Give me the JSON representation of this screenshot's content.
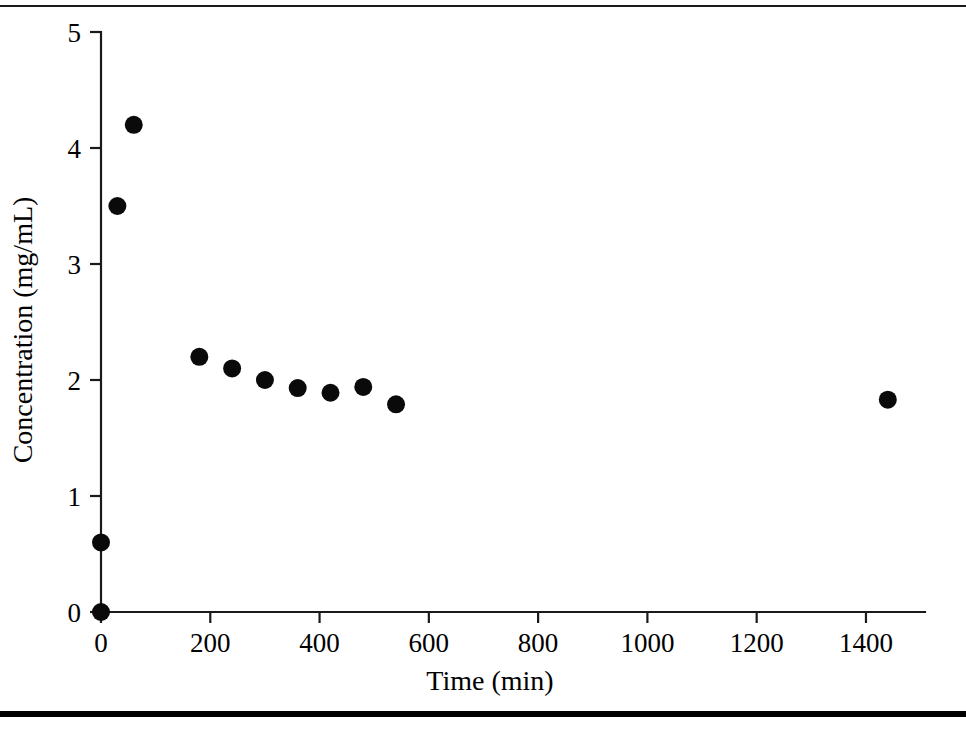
{
  "figure": {
    "type": "scatter-plot-figure",
    "background_color": "#ffffff",
    "ink_color": "#000000",
    "rules": {
      "top_rule_label": "page-rule-top",
      "bottom_rule_label": "page-rule-bottom"
    }
  },
  "chart_data": {
    "type": "scatter",
    "title": "",
    "subtitle": "",
    "xlabel": "Time (min)",
    "ylabel": "Concentration (mg/mL)",
    "xlim": [
      0,
      1510
    ],
    "ylim": [
      0,
      5
    ],
    "xticks": [
      0,
      200,
      400,
      600,
      800,
      1000,
      1200,
      1400
    ],
    "xtick_labels": [
      "0",
      "200",
      "400",
      "600",
      "800",
      "1000",
      "1200",
      "1400"
    ],
    "yticks": [
      0,
      1,
      2,
      3,
      4,
      5
    ],
    "ytick_labels": [
      "0",
      "1",
      "2",
      "3",
      "4",
      "5"
    ],
    "grid": false,
    "legend": null,
    "legend_position": "none",
    "marker": {
      "shape": "circle",
      "color": "#0a0a0a",
      "size_px": 18
    },
    "series": [
      {
        "name": "Concentration",
        "x": [
          0,
          0,
          30,
          60,
          180,
          240,
          300,
          360,
          420,
          480,
          540,
          1440
        ],
        "y": [
          0,
          0.6,
          3.5,
          4.2,
          2.2,
          2.1,
          2.0,
          1.93,
          1.89,
          1.94,
          1.79,
          1.83
        ]
      }
    ],
    "annotations": []
  }
}
